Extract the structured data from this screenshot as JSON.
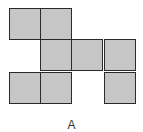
{
  "figure": {
    "label": "A",
    "cell_color": "#c6c6c6",
    "border_color": "#2a2a2a",
    "grid": {
      "rows": 3,
      "cols": 4,
      "filled_cells": [
        {
          "row": 0,
          "col": 0
        },
        {
          "row": 0,
          "col": 1
        },
        {
          "row": 1,
          "col": 1
        },
        {
          "row": 1,
          "col": 2
        },
        {
          "row": 1,
          "col": 3
        },
        {
          "row": 2,
          "col": 0
        },
        {
          "row": 2,
          "col": 1
        },
        {
          "row": 2,
          "col": 3
        }
      ]
    }
  }
}
